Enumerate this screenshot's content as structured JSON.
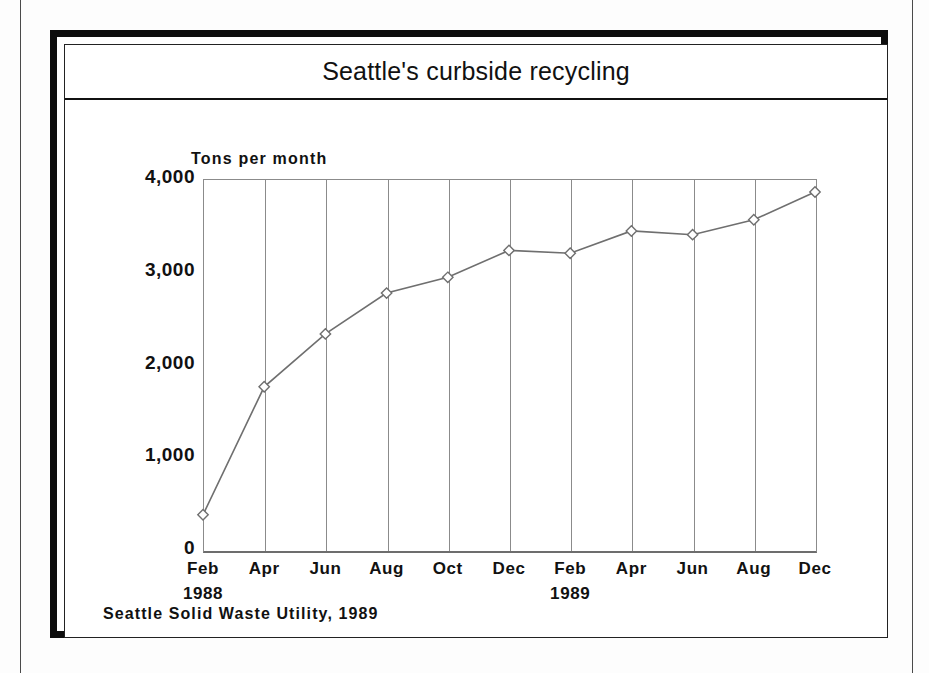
{
  "figure": {
    "title": "Seattle's curbside recycling",
    "source_note": "Seattle Solid Waste Utility, 1989"
  },
  "chart_data": {
    "type": "line",
    "title": "Seattle's curbside recycling",
    "xlabel": "",
    "ylabel": "Tons per month",
    "ylim": [
      0,
      4000
    ],
    "ytick_labels": [
      "4,000",
      "3,000",
      "2,000",
      "1,000",
      "0"
    ],
    "yticks": [
      4000,
      3000,
      2000,
      1000,
      0
    ],
    "grid": "vertical",
    "legend": "none",
    "marker": "open-diamond",
    "line_color": "#6f6f6f",
    "categories": [
      "Feb",
      "Apr",
      "Jun",
      "Aug",
      "Oct",
      "Dec",
      "Feb",
      "Apr",
      "Jun",
      "Aug",
      "Dec"
    ],
    "year_labels": [
      {
        "index": 0,
        "label": "1988"
      },
      {
        "index": 6,
        "label": "1989"
      }
    ],
    "values": [
      380,
      1760,
      2330,
      2770,
      2940,
      3230,
      3200,
      3440,
      3400,
      3560,
      3860
    ],
    "source": "Seattle Solid Waste Utility, 1989"
  }
}
